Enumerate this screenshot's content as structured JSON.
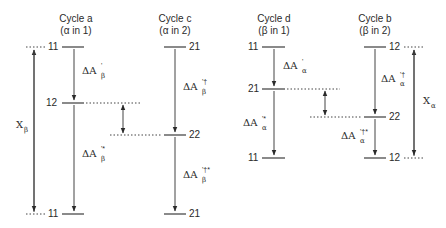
{
  "diagram": {
    "cycles": [
      {
        "id": "a",
        "title": "Cycle a",
        "subtitle": "(α in 1)",
        "levels": [
          "11",
          "12",
          "11"
        ],
        "transitions": [
          {
            "label": "ΔA",
            "sub": "β",
            "sup": "'"
          },
          {
            "label": "ΔA",
            "sub": "β",
            "sup": "'*"
          }
        ]
      },
      {
        "id": "c",
        "title": "Cycle c",
        "subtitle": "(α in 2)",
        "levels": [
          "21",
          "22",
          "21"
        ],
        "transitions": [
          {
            "label": "ΔA",
            "sub": "β",
            "sup": "'†"
          },
          {
            "label": "ΔA",
            "sub": "β",
            "sup": "'†*"
          }
        ]
      },
      {
        "id": "d",
        "title": "Cycle d",
        "subtitle": "(β in 1)",
        "levels": [
          "11",
          "21",
          "11"
        ],
        "transitions": [
          {
            "label": "ΔA",
            "sub": "α",
            "sup": "'"
          },
          {
            "label": "ΔA",
            "sub": "α",
            "sup": "'*"
          }
        ]
      },
      {
        "id": "b",
        "title": "Cycle b",
        "subtitle": "(β in 2)",
        "levels": [
          "12",
          "22",
          "12"
        ],
        "transitions": [
          {
            "label": "ΔA",
            "sub": "α",
            "sup": "'†"
          },
          {
            "label": "ΔA",
            "sub": "α",
            "sup": "'†*"
          }
        ]
      }
    ],
    "side_arrows": [
      {
        "label": "X",
        "sub": "β"
      },
      {
        "label": "X",
        "sub": "α"
      }
    ]
  }
}
